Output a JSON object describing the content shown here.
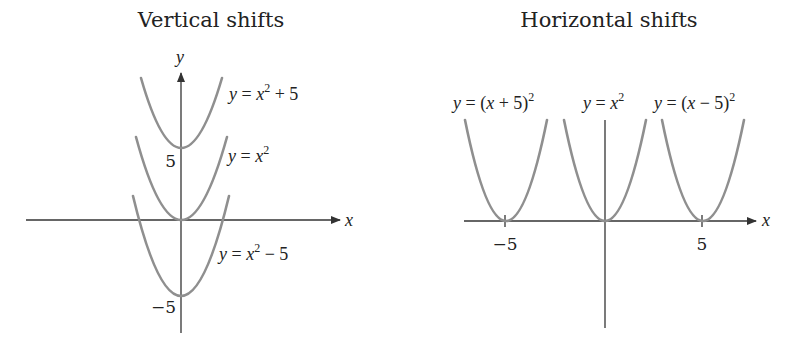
{
  "panels": [
    {
      "title": "Vertical shifts",
      "x_axis_label": "x",
      "y_axis_label": "y",
      "tick_labels": {
        "y_pos": "5",
        "y_neg": "−5"
      },
      "curves": [
        {
          "label_parts": [
            "y",
            " = ",
            "x",
            "2",
            " + 5"
          ],
          "equation": "y = x^2 + 5",
          "shift": 5
        },
        {
          "label_parts": [
            "y",
            " = ",
            "x",
            "2",
            ""
          ],
          "equation": "y = x^2",
          "shift": 0
        },
        {
          "label_parts": [
            "y",
            " = ",
            "x",
            "2",
            " − 5"
          ],
          "equation": "y = x^2 - 5",
          "shift": -5
        }
      ]
    },
    {
      "title": "Horizontal shifts",
      "x_axis_label": "x",
      "tick_labels": {
        "x_neg": "−5",
        "x_pos": "5"
      },
      "curves": [
        {
          "label_parts": [
            "y",
            " = (",
            "x",
            " + 5)",
            "2"
          ],
          "equation": "y = (x + 5)^2",
          "shift": -5
        },
        {
          "label_parts": [
            "y",
            " = ",
            "x",
            "2",
            ""
          ],
          "equation": "y = x^2",
          "shift": 0
        },
        {
          "label_parts": [
            "y",
            " = (",
            "x",
            " − 5)",
            "2"
          ],
          "equation": "y = (x - 5)^2",
          "shift": 5
        }
      ]
    }
  ],
  "colors": {
    "curve": "#8f8f8f",
    "axis": "#333333",
    "text": "#222222"
  }
}
